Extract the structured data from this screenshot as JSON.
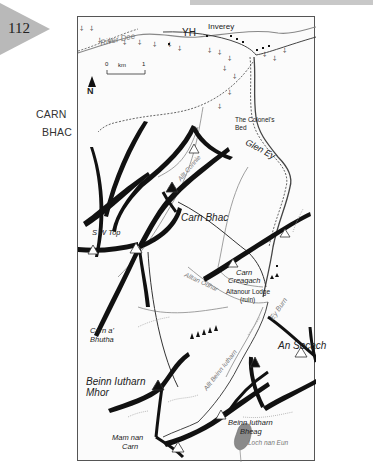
{
  "page": {
    "number": "112",
    "chapter_title_line1": "CARN",
    "chapter_title_line2": "BHAC"
  },
  "map": {
    "compass": {
      "label": "N",
      "icon": "north-arrow-icon"
    },
    "scale_bar": {
      "start": "0",
      "unit": "km",
      "end": "1"
    },
    "labels": {
      "river_dee": "River Dee",
      "yh": "YH",
      "inverey": "Inverey",
      "colonels_bed_1": "The Colonel's",
      "colonels_bed_2": "Bed",
      "glen_ey": "Glen Ey",
      "allt_connie": "Allt Connie",
      "carn_bhac": "Carn Bhac",
      "sw_top": "S W Top",
      "carn_creagach_1": "Carn",
      "carn_creagach_2": "Creagach",
      "altanour_lodge_1": "Altanour Lodge",
      "altanour_lodge_2": "(ruin)",
      "alltan_odhar": "Alltan Odhar",
      "ey_burn": "Ey Burn",
      "carn_a_bhutha_1": "Carn a'",
      "carn_a_bhutha_2": "Bhutha",
      "an_socach": "An Socach",
      "allt_beinn_iutharn": "Allt Beinn Iutharn",
      "beinn_iutharn_mhor_1": "Beinn Iutharn",
      "beinn_iutharn_mhor_2": "Mhor",
      "beinn_iutharn_bheag_1": "Beinn Iutharn",
      "beinn_iutharn_bheag_2": "Bheag",
      "mam_nan_carn_1": "Mam nan",
      "mam_nan_carn_2": "Carn",
      "loch_nan_eun": "Loch nan Eun"
    },
    "colors": {
      "ridge": "#111111",
      "river": "#888888",
      "track": "#666666",
      "loch": "#8a8a8a",
      "frame": "#555555",
      "page_tab": "#b9b9b9"
    }
  }
}
